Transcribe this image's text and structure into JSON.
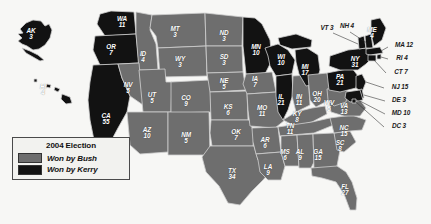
{
  "figure": {
    "background_color": "#f7f7f5"
  },
  "legend": {
    "title": "2004 Election",
    "entries": [
      {
        "label": "Won by Bush",
        "color": "#6e6e6e",
        "swatch_name": "bush-swatch"
      },
      {
        "label": "Won by Kerry",
        "color": "#121212",
        "swatch_name": "kerry-swatch"
      }
    ]
  },
  "chart_data": {
    "type": "map",
    "title": "2004 Election",
    "categories": [
      "Won by Bush",
      "Won by Kerry"
    ],
    "colors": {
      "Won by Bush": "#6e6e6e",
      "Won by Kerry": "#121212"
    },
    "value_label": "Electoral votes",
    "states": [
      {
        "abbr": "AK",
        "votes": 3,
        "winner": "Won by Kerry",
        "label": "AK 3",
        "x": 31,
        "y": 34,
        "placement": "inside"
      },
      {
        "abbr": "HI",
        "votes": 4,
        "winner": "Won by Kerry",
        "label": "HI 4",
        "x": 43,
        "y": 90,
        "placement": "inside"
      },
      {
        "abbr": "WA",
        "votes": 11,
        "winner": "Won by Kerry",
        "label": "WA 11",
        "x": 122,
        "y": 22,
        "placement": "inside"
      },
      {
        "abbr": "OR",
        "votes": 7,
        "winner": "Won by Kerry",
        "label": "OR 7",
        "x": 111,
        "y": 50,
        "placement": "inside"
      },
      {
        "abbr": "CA",
        "votes": 55,
        "winner": "Won by Kerry",
        "label": "CA 55",
        "x": 106,
        "y": 119,
        "placement": "inside"
      },
      {
        "abbr": "NV",
        "votes": 5,
        "winner": "Won by Bush",
        "label": "NV 5",
        "x": 128,
        "y": 88,
        "placement": "inside"
      },
      {
        "abbr": "ID",
        "votes": 4,
        "winner": "Won by Bush",
        "label": "ID 4",
        "x": 143,
        "y": 57,
        "placement": "inside"
      },
      {
        "abbr": "MT",
        "votes": 3,
        "winner": "Won by Bush",
        "label": "MT 3",
        "x": 175,
        "y": 32,
        "placement": "inside"
      },
      {
        "abbr": "WY",
        "votes": 3,
        "winner": "Won by Bush",
        "label": "WY 3",
        "x": 180,
        "y": 62,
        "placement": "inside"
      },
      {
        "abbr": "UT",
        "votes": 5,
        "winner": "Won by Bush",
        "label": "UT 5",
        "x": 152,
        "y": 98,
        "placement": "inside"
      },
      {
        "abbr": "CO",
        "votes": 9,
        "winner": "Won by Bush",
        "label": "CO 9",
        "x": 186,
        "y": 101,
        "placement": "inside"
      },
      {
        "abbr": "AZ",
        "votes": 10,
        "winner": "Won by Bush",
        "label": "AZ 10",
        "x": 147,
        "y": 133,
        "placement": "inside"
      },
      {
        "abbr": "NM",
        "votes": 5,
        "winner": "Won by Bush",
        "label": "NM 5",
        "x": 186,
        "y": 138,
        "placement": "inside"
      },
      {
        "abbr": "ND",
        "votes": 3,
        "winner": "Won by Bush",
        "label": "ND 3",
        "x": 224,
        "y": 36,
        "placement": "inside"
      },
      {
        "abbr": "SD",
        "votes": 3,
        "winner": "Won by Bush",
        "label": "SD 3",
        "x": 224,
        "y": 60,
        "placement": "inside"
      },
      {
        "abbr": "NE",
        "votes": 5,
        "winner": "Won by Bush",
        "label": "NE 5",
        "x": 224,
        "y": 84,
        "placement": "inside"
      },
      {
        "abbr": "KS",
        "votes": 6,
        "winner": "Won by Bush",
        "label": "KS 6",
        "x": 228,
        "y": 110,
        "placement": "inside"
      },
      {
        "abbr": "OK",
        "votes": 7,
        "winner": "Won by Bush",
        "label": "OK 7",
        "x": 236,
        "y": 135,
        "placement": "inside"
      },
      {
        "abbr": "TX",
        "votes": 34,
        "winner": "Won by Bush",
        "label": "TX 34",
        "x": 232,
        "y": 174,
        "placement": "inside"
      },
      {
        "abbr": "MN",
        "votes": 10,
        "winner": "Won by Kerry",
        "label": "MN 10",
        "x": 256,
        "y": 50,
        "placement": "inside"
      },
      {
        "abbr": "IA",
        "votes": 7,
        "winner": "Won by Bush",
        "label": "IA 7",
        "x": 255,
        "y": 82,
        "placement": "inside"
      },
      {
        "abbr": "MO",
        "votes": 11,
        "winner": "Won by Bush",
        "label": "MO 11",
        "x": 262,
        "y": 111,
        "placement": "inside"
      },
      {
        "abbr": "AR",
        "votes": 6,
        "winner": "Won by Bush",
        "label": "AR 6",
        "x": 265,
        "y": 143,
        "placement": "inside"
      },
      {
        "abbr": "LA",
        "votes": 9,
        "winner": "Won by Bush",
        "label": "LA 9",
        "x": 268,
        "y": 170,
        "placement": "inside"
      },
      {
        "abbr": "WI",
        "votes": 10,
        "winner": "Won by Kerry",
        "label": "WI 10",
        "x": 281,
        "y": 60,
        "placement": "inside"
      },
      {
        "abbr": "IL",
        "votes": 21,
        "winner": "Won by Kerry",
        "label": "IL 21",
        "x": 281,
        "y": 100,
        "placement": "inside"
      },
      {
        "abbr": "MS",
        "votes": 6,
        "winner": "Won by Bush",
        "label": "MS 6",
        "x": 285,
        "y": 155,
        "placement": "inside"
      },
      {
        "abbr": "TN",
        "votes": 11,
        "winner": "Won by Bush",
        "label": "TN 11",
        "x": 290,
        "y": 129,
        "placement": "inside"
      },
      {
        "abbr": "KY",
        "votes": 8,
        "winner": "Won by Bush",
        "label": "KY 8",
        "x": 297,
        "y": 117,
        "placement": "inside"
      },
      {
        "abbr": "IN",
        "votes": 11,
        "winner": "Won by Bush",
        "label": "IN 11",
        "x": 299,
        "y": 100,
        "placement": "inside"
      },
      {
        "abbr": "MI",
        "votes": 17,
        "winner": "Won by Kerry",
        "label": "MI 17",
        "x": 305,
        "y": 70,
        "placement": "inside"
      },
      {
        "abbr": "AL",
        "votes": 9,
        "winner": "Won by Bush",
        "label": "AL 9",
        "x": 300,
        "y": 155,
        "placement": "inside"
      },
      {
        "abbr": "OH",
        "votes": 20,
        "winner": "Won by Bush",
        "label": "OH 20",
        "x": 317,
        "y": 97,
        "placement": "inside"
      },
      {
        "abbr": "GA",
        "votes": 15,
        "winner": "Won by Bush",
        "label": "GA 15",
        "x": 318,
        "y": 155,
        "placement": "inside"
      },
      {
        "abbr": "WV",
        "votes": 5,
        "winner": "Won by Bush",
        "label": "WV 5",
        "x": 329,
        "y": 106,
        "placement": "inside"
      },
      {
        "abbr": "VA",
        "votes": 13,
        "winner": "Won by Bush",
        "label": "VA 13",
        "x": 344,
        "y": 109,
        "placement": "inside"
      },
      {
        "abbr": "NC",
        "votes": 15,
        "winner": "Won by Bush",
        "label": "NC 15",
        "x": 344,
        "y": 131,
        "placement": "inside"
      },
      {
        "abbr": "SC",
        "votes": 8,
        "winner": "Won by Bush",
        "label": "SC 8",
        "x": 340,
        "y": 146,
        "placement": "inside"
      },
      {
        "abbr": "FL",
        "votes": 27,
        "winner": "Won by Bush",
        "label": "FL 27",
        "x": 345,
        "y": 190,
        "placement": "inside"
      },
      {
        "abbr": "PA",
        "votes": 21,
        "winner": "Won by Kerry",
        "label": "PA 21",
        "x": 340,
        "y": 80,
        "placement": "inside"
      },
      {
        "abbr": "NY",
        "votes": 31,
        "winner": "Won by Kerry",
        "label": "NY 31",
        "x": 355,
        "y": 62,
        "placement": "inside"
      },
      {
        "abbr": "VT",
        "votes": 3,
        "winner": "Won by Kerry",
        "label": "VT 3",
        "x": 327,
        "y": 28,
        "placement": "outside"
      },
      {
        "abbr": "NH",
        "votes": 4,
        "winner": "Won by Kerry",
        "label": "NH 4",
        "x": 347,
        "y": 26,
        "placement": "outside"
      },
      {
        "abbr": "ME",
        "votes": 4,
        "winner": "Won by Kerry",
        "label": "ME 4",
        "x": 372,
        "y": 33,
        "placement": "inside"
      },
      {
        "abbr": "MA",
        "votes": 12,
        "winner": "Won by Kerry",
        "label": "MA 12",
        "x": 404,
        "y": 45,
        "placement": "outside"
      },
      {
        "abbr": "RI",
        "votes": 4,
        "winner": "Won by Kerry",
        "label": "RI 4",
        "x": 402,
        "y": 58,
        "placement": "outside"
      },
      {
        "abbr": "CT",
        "votes": 7,
        "winner": "Won by Kerry",
        "label": "CT 7",
        "x": 401,
        "y": 72,
        "placement": "outside"
      },
      {
        "abbr": "NJ",
        "votes": 15,
        "winner": "Won by Kerry",
        "label": "NJ 15",
        "x": 400,
        "y": 87,
        "placement": "outside"
      },
      {
        "abbr": "DE",
        "votes": 3,
        "winner": "Won by Kerry",
        "label": "DE 3",
        "x": 399,
        "y": 100,
        "placement": "outside"
      },
      {
        "abbr": "MD",
        "votes": 10,
        "winner": "Won by Kerry",
        "label": "MD 10",
        "x": 401,
        "y": 113,
        "placement": "outside"
      },
      {
        "abbr": "DC",
        "votes": 3,
        "winner": "Won by Kerry",
        "label": "DC 3",
        "x": 399,
        "y": 126,
        "placement": "outside"
      }
    ]
  }
}
